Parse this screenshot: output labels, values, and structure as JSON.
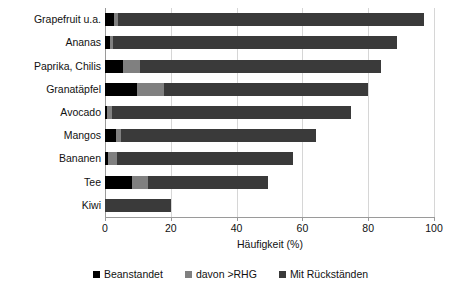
{
  "chart_data": {
    "type": "bar",
    "orientation": "horizontal",
    "stacked": true,
    "title": "",
    "xlabel": "Häufigkeit (%)",
    "ylabel": "",
    "xlim": [
      0,
      100
    ],
    "xticks": [
      0,
      20,
      40,
      60,
      80,
      100
    ],
    "xtick_labels": [
      "0",
      "20",
      "40",
      "60",
      "80",
      "100"
    ],
    "grid": true,
    "grid_axis": "x",
    "legend_position": "bottom",
    "categories": [
      "Grapefruit u.a.",
      "Ananas",
      "Paprika, Chilis",
      "Granatäpfel",
      "Avocado",
      "Mangos",
      "Bananen",
      "Tee",
      "Kiwi"
    ],
    "series": [
      {
        "name": "Beanstandet",
        "color": "#000000",
        "values": [
          2.7,
          1.5,
          5.5,
          9.7,
          0.6,
          3.4,
          1.0,
          8.2,
          0.0
        ]
      },
      {
        "name": "davon >RHG",
        "color": "#808080",
        "values": [
          1.3,
          1.0,
          5.1,
          8.3,
          1.5,
          1.6,
          2.5,
          4.8,
          0.0
        ]
      },
      {
        "name": "Mit Rückständen",
        "color": "#3a3a3a",
        "values": [
          93.0,
          86.3,
          73.4,
          62.0,
          72.7,
          59.0,
          53.5,
          36.5,
          20.0
        ]
      }
    ],
    "totals": [
      97.0,
      88.8,
      84.0,
      80.0,
      74.8,
      64.0,
      57.0,
      49.5,
      20.0
    ]
  },
  "legend": {
    "items": [
      {
        "label": "Beanstandet",
        "color": "#000000"
      },
      {
        "label": "davon >RHG",
        "color": "#808080"
      },
      {
        "label": "Mit Rückständen",
        "color": "#3a3a3a"
      }
    ]
  },
  "axis": {
    "x_title": "Häufigkeit (%)"
  }
}
